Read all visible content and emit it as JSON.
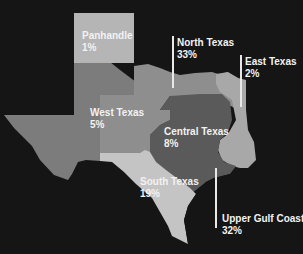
{
  "map": {
    "subject": "Texas regions",
    "background": "#151515",
    "regions": [
      {
        "name": "Panhandle",
        "value": "1%",
        "color": "#b5b5b5"
      },
      {
        "name": "North Texas",
        "value": "33%",
        "color": "#8e8e8e"
      },
      {
        "name": "East Texas",
        "value": "2%",
        "color": "#a8a8a8"
      },
      {
        "name": "West Texas",
        "value": "5%",
        "color": "#7c7c7c"
      },
      {
        "name": "Central Texas",
        "value": "8%",
        "color": "#5a5a5a"
      },
      {
        "name": "South Texas",
        "value": "19%",
        "color": "#c4c4c4"
      },
      {
        "name": "Upper Gulf Coast",
        "value": "32%",
        "color": "#151515"
      }
    ]
  }
}
